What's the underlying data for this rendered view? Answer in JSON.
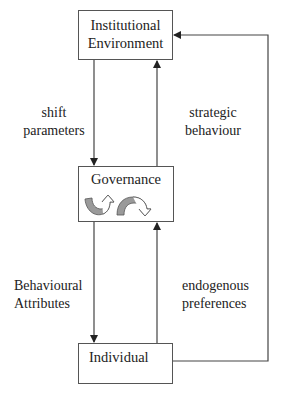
{
  "nodes": {
    "institutional": {
      "line1": "Institutional",
      "line2": "Environment"
    },
    "governance": {
      "label": "Governance",
      "icons": [
        "curved-arrow-up-icon",
        "curved-arrow-over-icon"
      ]
    },
    "individual": {
      "label": "Individual"
    }
  },
  "edges": {
    "shift_parameters": {
      "line1": "shift",
      "line2": "parameters"
    },
    "strategic_behaviour": {
      "line1": "strategic",
      "line2": "behaviour"
    },
    "behavioural_attributes": {
      "line1": "Behavioural",
      "line2": "Attributes"
    },
    "endogenous_preferences": {
      "line1": "endogenous",
      "line2": "preferences"
    }
  },
  "colors": {
    "line": "#444444",
    "icon_fill": "#9a9a9a"
  }
}
